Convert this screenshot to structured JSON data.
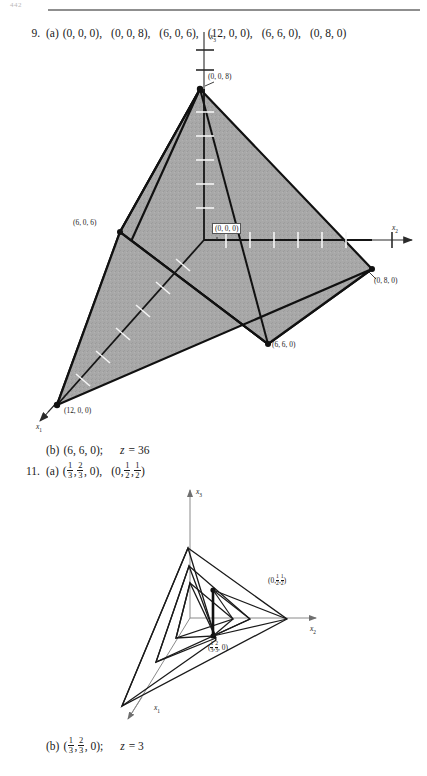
{
  "page": {
    "folio": "442",
    "rule_color": "#8f8f8f"
  },
  "exercises": [
    {
      "number": "9.",
      "part_a_label": "(a)",
      "part_a_tuples": [
        "(0, 0, 0),",
        "(0, 0, 8),",
        "(6, 0, 6),",
        "(12, 0, 0),",
        "(6, 6, 0),",
        "(0, 8, 0)"
      ],
      "part_b_label": "(b)",
      "part_b_point": "(6, 6, 0);",
      "part_b_z_var": "z",
      "part_b_z_eq": "= 36"
    },
    {
      "number": "11.",
      "part_a_label": "(a)",
      "part_a_tuple_1_pre": "(",
      "part_a_tuple_1_f1_n": "1",
      "part_a_tuple_1_f1_d": "3",
      "part_a_tuple_1_mid": ",",
      "part_a_tuple_1_f2_n": "2",
      "part_a_tuple_1_f2_d": "3",
      "part_a_tuple_1_post": ", 0),",
      "part_a_tuple_2_pre": "(0,",
      "part_a_tuple_2_f1_n": "1",
      "part_a_tuple_2_f1_d": "2",
      "part_a_tuple_2_mid": ",",
      "part_a_tuple_2_f2_n": "1",
      "part_a_tuple_2_f2_d": "2",
      "part_a_tuple_2_post": ")",
      "part_b_label": "(b)",
      "part_b_pre": "(",
      "part_b_f1_n": "1",
      "part_b_f1_d": "3",
      "part_b_mid": ",",
      "part_b_f2_n": "2",
      "part_b_f2_d": "3",
      "part_b_post": ", 0);",
      "part_b_z_var": "z",
      "part_b_z_eq": "= 3"
    }
  ],
  "figure1": {
    "caption_id": "feasible-region-3d-exercise-9",
    "axes": [
      {
        "name": "x3",
        "label_var": "x",
        "label_sub": "3"
      },
      {
        "name": "x2",
        "label_var": "x",
        "label_sub": "2"
      },
      {
        "name": "x1",
        "label_var": "x",
        "label_sub": "1"
      }
    ],
    "vertex_labels": [
      {
        "name": "vertex-0-0-8",
        "text": "(0, 0, 8)",
        "x": 208,
        "y": 53
      },
      {
        "name": "vertex-6-0-6",
        "text": "(6, 0, 6)",
        "x": 78,
        "y": 199
      },
      {
        "name": "vertex-0-0-0",
        "text": "(0, 0, 0)",
        "x": 210,
        "y": 203
      },
      {
        "name": "vertex-0-8-0",
        "text": "(0, 8, 0)",
        "x": 368,
        "y": 239
      },
      {
        "name": "vertex-6-6-0",
        "text": "(6, 6, 0)",
        "x": 258,
        "y": 307
      },
      {
        "name": "vertex-12-0-0",
        "text": "(12, 0, 0)",
        "x": 74,
        "y": 387
      }
    ],
    "fill_color": "#a8a8a8",
    "edge_color": "#111111",
    "axis_color": "#2a2a2a"
  },
  "figure2": {
    "caption_id": "nested-simplex-path-exercise-11",
    "axes": [
      {
        "name": "x3",
        "label_var": "x",
        "label_sub": "3"
      },
      {
        "name": "x2",
        "label_var": "x",
        "label_sub": "2"
      },
      {
        "name": "x1",
        "label_var": "x",
        "label_sub": "1"
      }
    ],
    "label_upper_pre": "(0,",
    "label_upper_f1_n": "1",
    "label_upper_f1_d": "2",
    "label_upper_mid": ",",
    "label_upper_f2_n": "1",
    "label_upper_f2_d": "2",
    "label_upper_post": ")",
    "label_lower_pre": "(",
    "label_lower_f1_n": "1",
    "label_lower_f1_d": "3",
    "label_lower_mid": ",",
    "label_lower_f2_n": "2",
    "label_lower_f2_d": "3",
    "label_lower_post": ", 0)",
    "line_color": "#1a1a1a",
    "axis_color": "#8a8a8a"
  }
}
